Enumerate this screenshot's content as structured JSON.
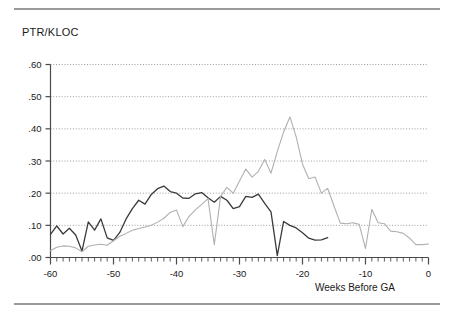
{
  "figure": {
    "title": "PTR/KLOC",
    "xlabel": "Weeks Before GA",
    "ylabel": ""
  },
  "chart_data": {
    "type": "line",
    "title": "PTR/KLOC",
    "xlabel": "Weeks Before GA",
    "ylabel": "PTR/KLOC",
    "xlim": [
      -60,
      0
    ],
    "ylim": [
      0.0,
      0.6
    ],
    "xticks": [
      -60,
      -50,
      -40,
      -30,
      -20,
      -10,
      0
    ],
    "xtick_labels": [
      "-60",
      "-50",
      "-40",
      "-30",
      "-20",
      "-10",
      "0"
    ],
    "xtick_minor_step": 1,
    "yticks": [
      0.0,
      0.1,
      0.2,
      0.3,
      0.4,
      0.5,
      0.6
    ],
    "ytick_labels": [
      ".00",
      ".10",
      ".20",
      ".30",
      ".40",
      ".50",
      ".60"
    ],
    "grid": true,
    "grid_style": "dotted",
    "legend": false,
    "series": [
      {
        "name": "series-dark",
        "color": "#3a3a3a",
        "x": [
          -60,
          -59,
          -58,
          -57,
          -56,
          -55,
          -54,
          -53,
          -52,
          -51,
          -50,
          -49,
          -48,
          -47,
          -46,
          -45,
          -44,
          -43,
          -42,
          -41,
          -40,
          -39,
          -38,
          -37,
          -36,
          -35,
          -34,
          -33,
          -32,
          -31,
          -30,
          -29,
          -28,
          -27,
          -26,
          -25,
          -24,
          -23,
          -22,
          -21,
          -20,
          -19,
          -18,
          -17,
          -16
        ],
        "values": [
          0.072,
          0.098,
          0.073,
          0.091,
          0.07,
          0.02,
          0.111,
          0.085,
          0.12,
          0.061,
          0.053,
          0.078,
          0.12,
          0.152,
          0.178,
          0.166,
          0.196,
          0.214,
          0.222,
          0.205,
          0.2,
          0.185,
          0.184,
          0.198,
          0.202,
          0.186,
          0.172,
          0.19,
          0.178,
          0.152,
          0.158,
          0.19,
          0.187,
          0.197,
          0.168,
          0.142,
          0.006,
          0.112,
          0.1,
          0.092,
          0.077,
          0.06,
          0.054,
          0.055,
          0.062
        ]
      },
      {
        "name": "series-light",
        "color": "#b0b0b0",
        "x": [
          -60,
          -59,
          -58,
          -57,
          -56,
          -55,
          -54,
          -53,
          -52,
          -51,
          -50,
          -49,
          -48,
          -47,
          -46,
          -45,
          -44,
          -43,
          -42,
          -41,
          -40,
          -39,
          -38,
          -37,
          -36,
          -35,
          -34,
          -33,
          -32,
          -31,
          -30,
          -29,
          -28,
          -27,
          -26,
          -25,
          -24,
          -23,
          -22,
          -21,
          -20,
          -19,
          -18,
          -17,
          -16,
          -15,
          -14,
          -13,
          -12,
          -11,
          -10,
          -9,
          -8,
          -7,
          -6,
          -5,
          -4,
          -3,
          -2,
          -1,
          0
        ],
        "values": [
          0.021,
          0.032,
          0.036,
          0.035,
          0.03,
          0.018,
          0.035,
          0.039,
          0.041,
          0.038,
          0.052,
          0.066,
          0.075,
          0.085,
          0.09,
          0.095,
          0.1,
          0.11,
          0.122,
          0.14,
          0.148,
          0.096,
          0.128,
          0.148,
          0.165,
          0.183,
          0.04,
          0.19,
          0.218,
          0.2,
          0.238,
          0.275,
          0.25,
          0.268,
          0.305,
          0.262,
          0.33,
          0.39,
          0.437,
          0.375,
          0.29,
          0.245,
          0.25,
          0.2,
          0.215,
          0.16,
          0.107,
          0.105,
          0.108,
          0.103,
          0.028,
          0.15,
          0.108,
          0.105,
          0.082,
          0.08,
          0.075,
          0.06,
          0.04,
          0.04,
          0.042
        ]
      }
    ]
  }
}
